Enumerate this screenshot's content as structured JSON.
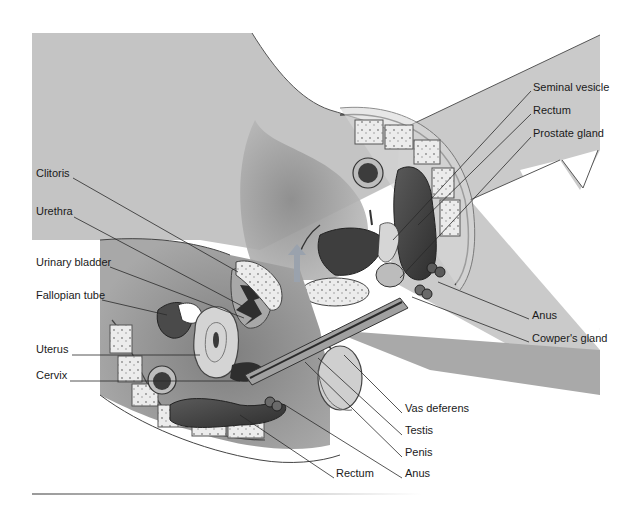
{
  "figure": {
    "colors": {
      "background": "#ffffff",
      "body_fill": "#c6c6c6",
      "body_dark": "#8a8a8a",
      "cavity": "#9c9c9c",
      "organ_dark": "#4a4a4a",
      "bone": "#e6e6e6",
      "outline": "#3a3a3a",
      "label_text": "#1a1a1a"
    },
    "labels_left": [
      {
        "text": "Clitoris",
        "x": 36,
        "y": 173
      },
      {
        "text": "Urethra",
        "x": 36,
        "y": 211
      },
      {
        "text": "Urinary bladder",
        "x": 36,
        "y": 262
      },
      {
        "text": "Fallopian tube",
        "x": 36,
        "y": 295
      },
      {
        "text": "Uterus",
        "x": 36,
        "y": 349
      },
      {
        "text": "Cervix",
        "x": 36,
        "y": 375
      }
    ],
    "labels_right_top": [
      {
        "text": "Seminal vesicle",
        "x": 533,
        "y": 87
      },
      {
        "text": "Rectum",
        "x": 533,
        "y": 110
      },
      {
        "text": "Prostate gland",
        "x": 533,
        "y": 133
      }
    ],
    "labels_right_mid": [
      {
        "text": "Anus",
        "x": 532,
        "y": 315
      },
      {
        "text": "Cowper's gland",
        "x": 532,
        "y": 338
      }
    ],
    "labels_bottom": [
      {
        "text": "Vas deferens",
        "x": 405,
        "y": 408
      },
      {
        "text": "Testis",
        "x": 405,
        "y": 430
      },
      {
        "text": "Penis",
        "x": 405,
        "y": 452
      },
      {
        "text": "Rectum",
        "x": 336,
        "y": 473
      },
      {
        "text": "Anus",
        "x": 405,
        "y": 473
      }
    ]
  }
}
